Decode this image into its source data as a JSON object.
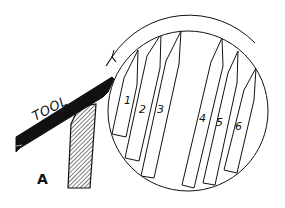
{
  "figure": {
    "labels": {
      "tool": "TOOL",
      "rest": "A"
    },
    "inset": {
      "rotation_direction": "counter-clockwise",
      "tips": [
        {
          "id": 1,
          "label": "1"
        },
        {
          "id": 2,
          "label": "2"
        },
        {
          "id": 3,
          "label": "3"
        },
        {
          "id": 4,
          "label": "4"
        },
        {
          "id": 5,
          "label": "5"
        },
        {
          "id": 6,
          "label": "6"
        }
      ]
    },
    "colors": {
      "ink": "#111111",
      "background": "#ffffff"
    }
  }
}
